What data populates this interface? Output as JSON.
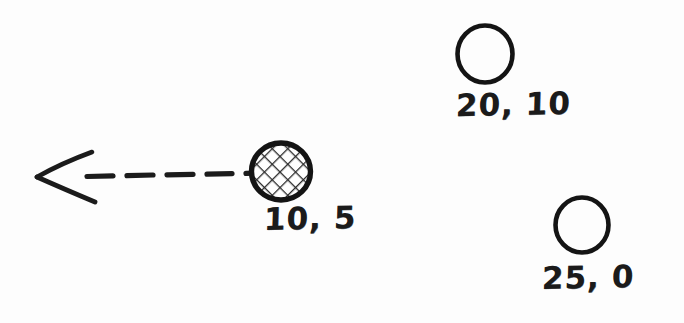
{
  "diagram": {
    "style": "hand-drawn pencil sketch",
    "background_color": "#fdfdfd",
    "ink_color": "#1b1b1b",
    "width": 684,
    "height": 323,
    "nodes": [
      {
        "id": "node-hatched",
        "label": "10, 5",
        "x": 10,
        "y": 5,
        "fill": "cross-hatched",
        "cx": 281,
        "cy": 171,
        "r": 29,
        "label_x": 264,
        "label_y": 200
      },
      {
        "id": "node-top-right",
        "label": "20, 10",
        "x": 20,
        "y": 10,
        "fill": "empty",
        "cx": 485,
        "cy": 54,
        "r": 27,
        "label_x": 456,
        "label_y": 86
      },
      {
        "id": "node-bottom-right",
        "label": "25, 0",
        "x": 25,
        "y": 0,
        "fill": "empty",
        "cx": 582,
        "cy": 225,
        "r": 26,
        "label_x": 542,
        "label_y": 259
      }
    ],
    "arrow": {
      "id": "motion-arrow",
      "direction": "left",
      "line_style": "dashed",
      "dash_count": 5,
      "head_style": "open-chevron",
      "tip_x": 36,
      "tip_y": 177,
      "tail_x": 248,
      "tail_y": 173,
      "from_node": "node-hatched"
    }
  }
}
